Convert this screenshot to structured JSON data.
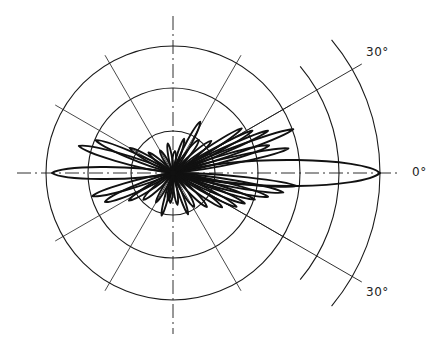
{
  "diagram": {
    "type": "polar-radiation-pattern",
    "center": [
      173,
      173
    ],
    "ring_radii": [
      42,
      85,
      127
    ],
    "outer_arc_radii": [
      166,
      207
    ],
    "outer_arc_span_deg": 40,
    "spoke_angles_deg": [
      30,
      60,
      120,
      150,
      210,
      240,
      300,
      330
    ],
    "spoke_length": 136,
    "ref_line_angles_deg": [
      30,
      -30
    ],
    "ref_line_length": 218,
    "axis": {
      "h_from": 17,
      "h_to": 397,
      "v_from": 16,
      "v_to": 334
    },
    "line_color": "#1a1a1a",
    "labels": [
      {
        "text": "30°",
        "x": 366,
        "y": 45
      },
      {
        "text": "0°",
        "x": 412,
        "y": 165
      },
      {
        "text": "30°",
        "x": 366,
        "y": 285
      }
    ],
    "lobes": [
      {
        "angle": 0,
        "length": 207,
        "width": 15
      },
      {
        "angle": 180,
        "length": 121,
        "width": 7
      },
      {
        "angle": 12,
        "length": 118,
        "width": 4
      },
      {
        "angle": 16,
        "length": 100,
        "width": 4
      },
      {
        "angle": 20,
        "length": 128,
        "width": 4
      },
      {
        "angle": 24,
        "length": 104,
        "width": 3
      },
      {
        "angle": 28,
        "length": 90,
        "width": 3
      },
      {
        "angle": 33,
        "length": 82,
        "width": 3
      },
      {
        "angle": 40,
        "length": 50,
        "width": 3
      },
      {
        "angle": 52,
        "length": 42,
        "width": 3
      },
      {
        "angle": 62,
        "length": 58,
        "width": 3
      },
      {
        "angle": 72,
        "length": 36,
        "width": 2
      },
      {
        "angle": 85,
        "length": 22,
        "width": 2
      },
      {
        "angle": -6,
        "length": 124,
        "width": 4
      },
      {
        "angle": -10,
        "length": 112,
        "width": 4
      },
      {
        "angle": -14,
        "length": 98,
        "width": 4
      },
      {
        "angle": -18,
        "length": 86,
        "width": 3
      },
      {
        "angle": -23,
        "length": 78,
        "width": 3
      },
      {
        "angle": -28,
        "length": 72,
        "width": 3
      },
      {
        "angle": -35,
        "length": 60,
        "width": 3
      },
      {
        "angle": -45,
        "length": 48,
        "width": 3
      },
      {
        "angle": -58,
        "length": 40,
        "width": 3
      },
      {
        "angle": -70,
        "length": 44,
        "width": 2
      },
      {
        "angle": -82,
        "length": 32,
        "width": 2
      },
      {
        "angle": -100,
        "length": 28,
        "width": 2
      },
      {
        "angle": 164,
        "length": 98,
        "width": 5
      },
      {
        "angle": 157,
        "length": 84,
        "width": 4
      },
      {
        "angle": 150,
        "length": 50,
        "width": 3
      },
      {
        "angle": 140,
        "length": 32,
        "width": 2
      },
      {
        "angle": 120,
        "length": 26,
        "width": 2
      },
      {
        "angle": 100,
        "length": 30,
        "width": 2
      },
      {
        "angle": 196,
        "length": 84,
        "width": 4
      },
      {
        "angle": 203,
        "length": 74,
        "width": 4
      },
      {
        "angle": 212,
        "length": 52,
        "width": 3
      },
      {
        "angle": 222,
        "length": 40,
        "width": 3
      },
      {
        "angle": 240,
        "length": 34,
        "width": 2
      },
      {
        "angle": 255,
        "length": 44,
        "width": 2
      },
      {
        "angle": 265,
        "length": 30,
        "width": 2
      }
    ]
  }
}
